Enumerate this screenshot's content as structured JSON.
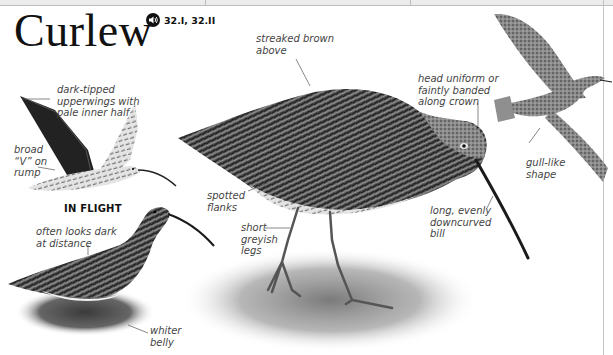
{
  "page": {
    "title": "Curlew",
    "audio": {
      "icon": "speaker-icon",
      "reference": "32.I, 32.II"
    },
    "illustrations": [
      {
        "id": "in-flight-upper",
        "caption": "IN FLIGHT"
      },
      {
        "id": "wading"
      },
      {
        "id": "standing-main"
      },
      {
        "id": "flying-right"
      }
    ],
    "annotations": {
      "wings": "dark-tipped\nupperwings with\npale inner half",
      "rump": "broad\n“V” on\nrump",
      "dark": "often looks dark\nat distance",
      "belly": "whiter\nbelly",
      "streaked": "streaked brown\nabove",
      "flanks": "spotted\nflanks",
      "legs": "short\ngreyish\nlegs",
      "head": "head uniform or\nfaintly banded\nalong crown",
      "bill": "long, evenly\ndowncurved\nbill",
      "shape": "gull-like\nshape"
    },
    "colors": {
      "text": "#111111",
      "annotation": "#444444",
      "rule": "#c4c4c4",
      "plumage_dark": "#2b2b2b",
      "plumage_mid": "#6e6e6e",
      "plumage_light": "#d9d9d9"
    }
  }
}
